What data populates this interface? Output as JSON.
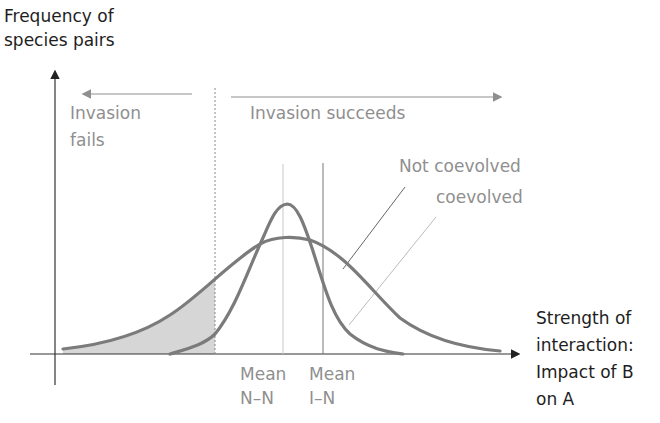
{
  "diagram": {
    "y_axis_label": [
      "Frequency of",
      "species pairs"
    ],
    "x_axis_label": [
      "Strength of",
      "interaction:",
      "Impact of B",
      "on A"
    ],
    "regions": {
      "fails": {
        "label": [
          "Invasion",
          "fails"
        ],
        "arrow_direction": "left"
      },
      "succeeds": {
        "label": "Invasion succeeds",
        "arrow_direction": "right"
      }
    },
    "curves": [
      {
        "name": "Not coevolved",
        "shape": "wide normal",
        "shaded_tail": "left of invasion threshold"
      },
      {
        "name": "coevolved",
        "shape": "narrow normal"
      }
    ],
    "markers": [
      {
        "label": [
          "Mean",
          "N–N"
        ]
      },
      {
        "label": [
          "Mean",
          "I–N"
        ]
      }
    ],
    "colors": {
      "curve": "#7b7b7b",
      "shade": "#d4d4d4",
      "label_grey": "#8f8f8f",
      "label_dark": "#1e1e1e",
      "axis": "#333333"
    }
  }
}
